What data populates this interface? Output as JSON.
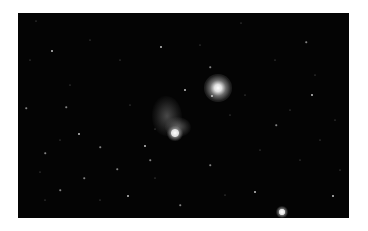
{
  "image": {
    "subject": "star field with nebula",
    "background": "#040404",
    "frame": {
      "x": 18,
      "y": 13,
      "width": 331,
      "height": 205
    }
  },
  "bright_stars": [
    {
      "x": 218,
      "y": 88,
      "glow": 28,
      "core": 5
    },
    {
      "x": 175,
      "y": 133,
      "glow": 16,
      "core": 5
    },
    {
      "x": 282,
      "y": 212,
      "glow": 12,
      "core": 4
    }
  ],
  "nebula": [
    {
      "x": 167,
      "y": 116,
      "w": 30,
      "h": 40,
      "opacity": 0.35
    },
    {
      "x": 178,
      "y": 127,
      "w": 26,
      "h": 20,
      "opacity": 0.45
    }
  ],
  "stars": [
    [
      52,
      51,
      2
    ],
    [
      161,
      47,
      2
    ],
    [
      66,
      107,
      1.5
    ],
    [
      79,
      134,
      2
    ],
    [
      45,
      153,
      1.5
    ],
    [
      100,
      147,
      1.5
    ],
    [
      84,
      178,
      1.5
    ],
    [
      128,
      196,
      2
    ],
    [
      117,
      169,
      1.5
    ],
    [
      145,
      146,
      2
    ],
    [
      185,
      90,
      2
    ],
    [
      212,
      96,
      2
    ],
    [
      155,
      129,
      1
    ],
    [
      312,
      95,
      2
    ],
    [
      276,
      125,
      1.5
    ],
    [
      255,
      192,
      2
    ],
    [
      333,
      196,
      2
    ],
    [
      306,
      42,
      1.5
    ],
    [
      241,
      23,
      1
    ],
    [
      36,
      21,
      1
    ],
    [
      210,
      67,
      1.5
    ],
    [
      26,
      108,
      1.5
    ],
    [
      40,
      172,
      1
    ],
    [
      60,
      190,
      1.5
    ],
    [
      100,
      200,
      1
    ],
    [
      150,
      160,
      1.5
    ],
    [
      155,
      178,
      1
    ],
    [
      210,
      165,
      1.5
    ],
    [
      245,
      95,
      1
    ],
    [
      275,
      60,
      1
    ],
    [
      300,
      160,
      1
    ],
    [
      320,
      140,
      1
    ],
    [
      340,
      170,
      1
    ],
    [
      30,
      60,
      1
    ],
    [
      120,
      60,
      1
    ],
    [
      90,
      40,
      1
    ],
    [
      70,
      85,
      1
    ],
    [
      130,
      105,
      1
    ],
    [
      200,
      45,
      1
    ],
    [
      230,
      115,
      1
    ],
    [
      260,
      150,
      1
    ],
    [
      290,
      110,
      1
    ],
    [
      315,
      75,
      1
    ],
    [
      335,
      120,
      1
    ],
    [
      45,
      200,
      1
    ],
    [
      180,
      205,
      1.5
    ],
    [
      225,
      195,
      1
    ],
    [
      60,
      140,
      1
    ]
  ]
}
